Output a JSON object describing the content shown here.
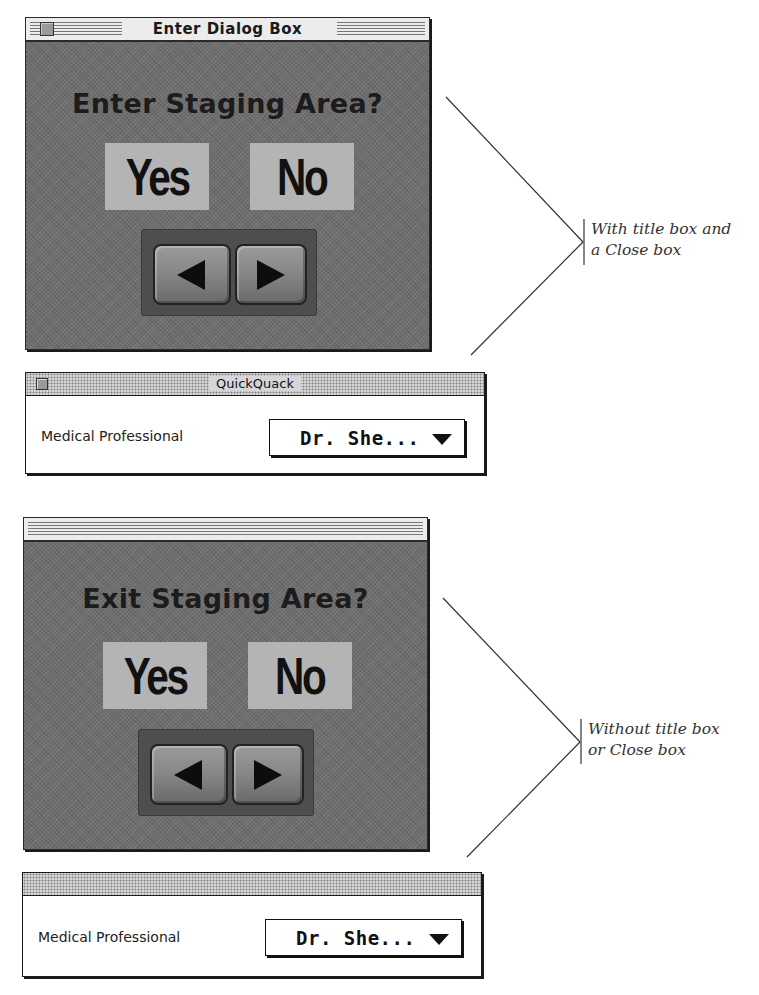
{
  "window_with_title": {
    "title": "Enter Dialog Box",
    "question": "Enter Staging Area?",
    "yes_label": "Yes",
    "no_label": "No",
    "nav": {
      "prev_icon": "left-triangle-icon",
      "next_icon": "right-triangle-icon"
    }
  },
  "palette_with_title": {
    "title": "QuickQuack",
    "field_label": "Medical Professional",
    "popup_value": "Dr. She...",
    "popup_icon": "triangle-down-icon"
  },
  "window_without_title": {
    "question": "Exit Staging Area?",
    "yes_label": "Yes",
    "no_label": "No",
    "nav": {
      "prev_icon": "left-triangle-icon",
      "next_icon": "right-triangle-icon"
    }
  },
  "palette_without_title": {
    "field_label": "Medical Professional",
    "popup_value": "Dr. She...",
    "popup_icon": "triangle-down-icon"
  },
  "callouts": {
    "top": {
      "line1": "With title box and",
      "line2": "a Close box"
    },
    "bottom": {
      "line1": "Without title box",
      "line2": "or Close box"
    }
  },
  "colors": {
    "window_body": "#6f6f6f",
    "choice_box": "#b4b4b4",
    "titlebar": "#ececec",
    "ink": "#111111"
  }
}
